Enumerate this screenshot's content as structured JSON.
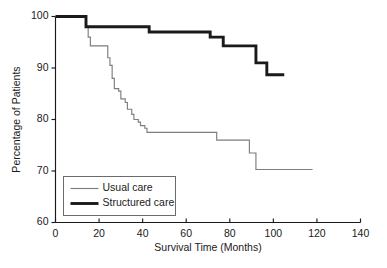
{
  "chart_data": {
    "type": "line",
    "title": "",
    "subtitle": "",
    "xlabel": "Survival Time (Months)",
    "ylabel": "Percentage of Patients",
    "xlim": [
      0,
      140
    ],
    "ylim": [
      60,
      100
    ],
    "xticks": [
      0,
      20,
      40,
      60,
      80,
      100,
      120,
      140
    ],
    "yticks": [
      60,
      70,
      80,
      90,
      100
    ],
    "grid": false,
    "legend_position": "lower-left",
    "step_type": "post",
    "series": [
      {
        "name": "Usual care",
        "color": "#7d7d7d",
        "line_width": "thin",
        "points": [
          [
            0,
            100.0
          ],
          [
            13,
            100.0
          ],
          [
            14,
            98.0
          ],
          [
            15,
            96.0
          ],
          [
            16,
            94.3
          ],
          [
            23,
            94.3
          ],
          [
            24,
            92.0
          ],
          [
            25,
            90.5
          ],
          [
            26,
            88.0
          ],
          [
            27,
            86.0
          ],
          [
            29,
            85.5
          ],
          [
            30,
            84.0
          ],
          [
            32,
            83.3
          ],
          [
            33,
            82.0
          ],
          [
            35,
            81.0
          ],
          [
            36,
            80.0
          ],
          [
            38,
            79.5
          ],
          [
            39,
            78.8
          ],
          [
            41,
            78.3
          ],
          [
            42,
            77.5
          ],
          [
            73,
            77.5
          ],
          [
            74,
            76.0
          ],
          [
            88,
            76.0
          ],
          [
            89,
            73.5
          ],
          [
            91,
            73.5
          ],
          [
            92,
            70.3
          ],
          [
            118,
            70.3
          ]
        ]
      },
      {
        "name": "Structured care",
        "color": "#1a1a1a",
        "line_width": "thick",
        "points": [
          [
            0,
            100.0
          ],
          [
            13,
            100.0
          ],
          [
            14,
            98.0
          ],
          [
            42,
            98.0
          ],
          [
            43,
            97.0
          ],
          [
            70,
            97.0
          ],
          [
            71,
            96.0
          ],
          [
            76,
            96.0
          ],
          [
            77,
            94.3
          ],
          [
            91,
            94.3
          ],
          [
            92,
            91.0
          ],
          [
            96,
            91.0
          ],
          [
            97,
            88.7
          ],
          [
            105,
            88.7
          ]
        ]
      }
    ]
  },
  "legend": {
    "entries": [
      {
        "label": "Usual care"
      },
      {
        "label": "Structured care"
      }
    ]
  },
  "colors": {
    "usual_care": "#7d7d7d",
    "structured_care": "#1a1a1a",
    "axis": "#1a1a1a",
    "background": "#ffffff"
  }
}
